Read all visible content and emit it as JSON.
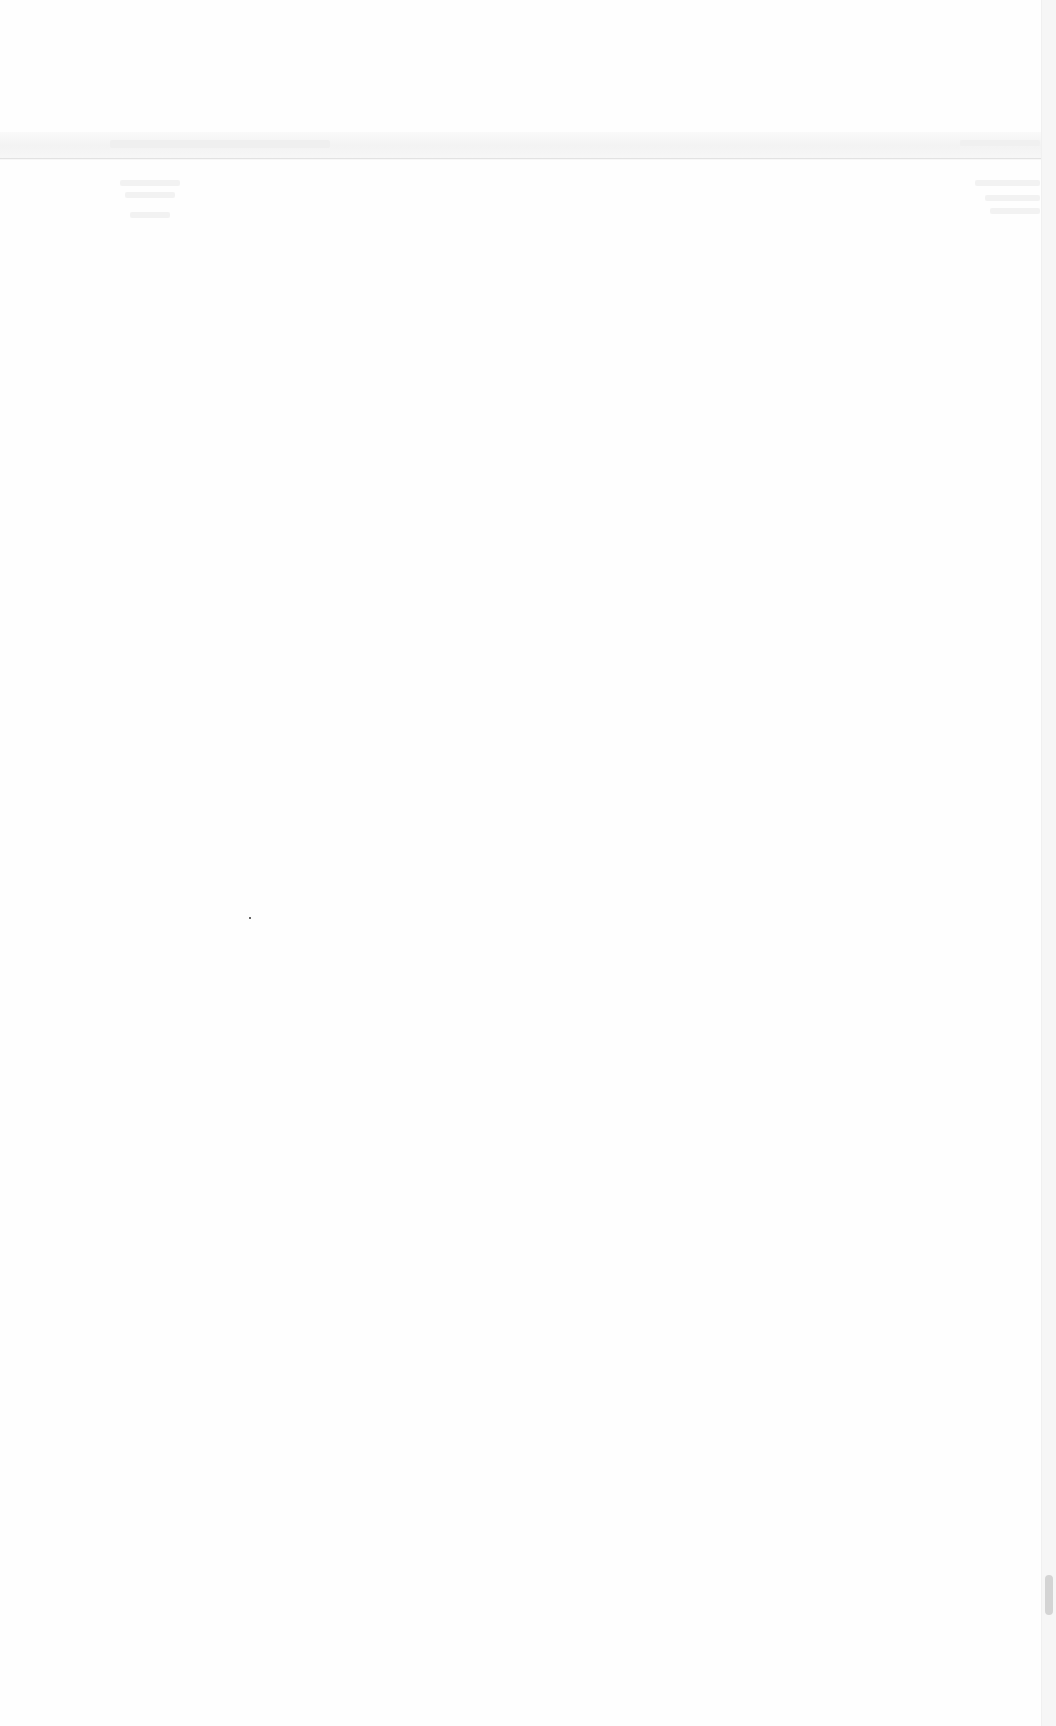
{
  "page": {
    "background": "#fefefe",
    "content_legible": false
  },
  "header": {
    "band_color": "#f3f3f3",
    "divider_color": "#e2e2e2",
    "left_text": "",
    "right_text": ""
  },
  "content": {
    "left_lines": [
      "",
      "",
      ""
    ],
    "right_lines": [
      "",
      "",
      ""
    ]
  },
  "scrollbar": {
    "orientation": "vertical",
    "track_color": "#f6f6f6",
    "thumb_color": "#d4d4d4",
    "thumb_top_px": 1575,
    "thumb_height_px": 40
  }
}
